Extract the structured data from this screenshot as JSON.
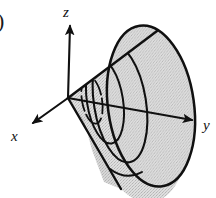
{
  "figure": {
    "kind": "3d-elliptical-cone-diagram",
    "caption_fragment": ")",
    "background_color": "#ffffff",
    "outline_color": "#101010",
    "surface_fill_color": "#d9d9d9",
    "surface_shadow_color": "#bfbfbf",
    "axes": {
      "origin": {
        "x": 68,
        "y": 98
      },
      "items": [
        {
          "name": "z",
          "label": "z",
          "label_x": 63,
          "label_y": 17,
          "tip_x": 70,
          "tip_y": 22,
          "direction": "up"
        },
        {
          "name": "y",
          "label": "y",
          "label_x": 203,
          "label_y": 130,
          "tip_x": 197,
          "tip_y": 122,
          "direction": "down-right"
        },
        {
          "name": "x",
          "label": "x",
          "label_x": 11,
          "label_y": 141,
          "tip_x": 28,
          "tip_y": 127,
          "direction": "down-left"
        }
      ]
    },
    "cone": {
      "apex_x": 68,
      "apex_y": 98,
      "upper_edge_x": 157,
      "upper_edge_y": 31,
      "lower_edge_x": 121,
      "lower_edge_y": 189,
      "front_ellipse": {
        "center_x": 151,
        "center_y": 106,
        "radius_x": 43,
        "radius_y": 81,
        "rotation_deg": -8
      },
      "cross_sections": [
        {
          "name": "inner-small-ellipse",
          "center_x": 92,
          "center_y": 100,
          "radius_x": 10,
          "radius_y": 24,
          "rotation_deg": -10
        },
        {
          "name": "inner-medium-ellipse",
          "center_x": 105,
          "center_y": 101,
          "radius_x": 18,
          "radius_y": 43,
          "rotation_deg": -9
        },
        {
          "name": "inner-large-ellipse",
          "center_x": 120,
          "center_y": 103,
          "radius_x": 26,
          "radius_y": 60,
          "rotation_deg": -9
        }
      ],
      "bottom_arc": {
        "start_x": 110,
        "start_y": 169,
        "end_x": 142,
        "end_y": 174
      }
    }
  }
}
